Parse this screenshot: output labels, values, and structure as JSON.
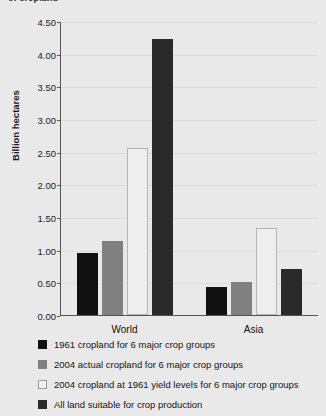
{
  "figure": {
    "clipped_title": "of cropland",
    "background_color": "#e9e9e9"
  },
  "chart_data": {
    "type": "bar",
    "title": "",
    "xlabel": "",
    "ylabel": "Billion hectares",
    "categories": [
      "World",
      "Asia"
    ],
    "ylim": [
      0.0,
      4.5
    ],
    "ytick_labels": [
      "4.50",
      "4.00",
      "3.50",
      "3.00",
      "2.50",
      "2.00",
      "1.50",
      "1.00",
      "0.50",
      "0.00"
    ],
    "ytick_values": [
      4.5,
      4.0,
      3.5,
      3.0,
      2.5,
      2.0,
      1.5,
      1.0,
      0.5,
      0.0
    ],
    "grid": true,
    "legend_position": "bottom-left",
    "series": [
      {
        "name": "1961 cropland for 6 major crop groups",
        "color": "#111111",
        "values": [
          0.95,
          0.43
        ]
      },
      {
        "name": "2004 actual cropland for 6 major crop groups",
        "color": "#808080",
        "values": [
          1.13,
          0.5
        ]
      },
      {
        "name": "2004 cropland at 1961 yield levels for 6 major crop groups",
        "color": "#eeeeee",
        "values": [
          2.56,
          1.33
        ]
      },
      {
        "name": "All land suitable for crop production",
        "color": "#2a2a2a",
        "values": [
          4.22,
          0.71
        ]
      }
    ]
  }
}
